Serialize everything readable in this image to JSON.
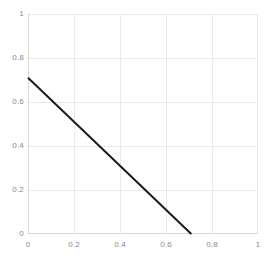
{
  "chart_data": {
    "type": "line",
    "title": "",
    "subtitle": "",
    "xlabel": "",
    "ylabel": "",
    "xlim": [
      0,
      1
    ],
    "ylim": [
      0,
      1
    ],
    "grid": true,
    "legend": null,
    "legend_position": "none",
    "xticks": [
      "0",
      "0.2",
      "0.4",
      "0.6",
      "0.8",
      "1"
    ],
    "xtick_values": [
      0,
      0.2,
      0.4,
      0.6,
      0.8,
      1
    ],
    "yticks": [
      "0",
      "0.2",
      "0.4",
      "0.6",
      "0.8",
      "1"
    ],
    "ytick_values": [
      0,
      0.2,
      0.4,
      0.6,
      0.8,
      1
    ],
    "series": [
      {
        "name": "line",
        "color": "#1a1a1a",
        "width": 2,
        "x": [
          0,
          0.71
        ],
        "y": [
          0.71,
          0
        ]
      }
    ],
    "annotations": []
  },
  "colors": {
    "background": "#ffffff",
    "gridline": "#e9e9e9",
    "axis": "#d6d6d6",
    "tick_label": "#8a8a8a",
    "line": "#1a1a1a"
  }
}
